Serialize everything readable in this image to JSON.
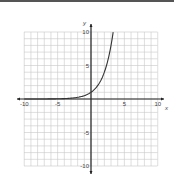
{
  "chart_data": {
    "type": "line",
    "title": "",
    "xlabel": "x",
    "ylabel": "y",
    "xlim": [
      -10,
      10
    ],
    "ylim": [
      -10,
      10
    ],
    "grid": true,
    "x_ticks": [
      -10,
      -5,
      5,
      10
    ],
    "y_ticks": [
      10,
      5,
      -5,
      -10
    ],
    "tick_labels": {
      "x": [
        "-10",
        "-5",
        "5",
        "10"
      ],
      "y": [
        "10",
        "5",
        "-5",
        "-10"
      ]
    },
    "series": [
      {
        "name": "exponential curve",
        "description": "Exponential growth curve approaching 0 to the left, passing through (0, 1)",
        "x": [
          -10,
          -8,
          -6,
          -4,
          -3,
          -2,
          -1,
          0,
          1,
          2,
          2.5,
          3,
          3.32
        ],
        "y": [
          0.001,
          0.004,
          0.016,
          0.06,
          0.125,
          0.25,
          0.5,
          1,
          2,
          4,
          5.66,
          8,
          10
        ]
      }
    ],
    "legend": null,
    "colors": {
      "curve": "#333333",
      "axes": "#222222",
      "grid": "#c8c8c8"
    }
  }
}
